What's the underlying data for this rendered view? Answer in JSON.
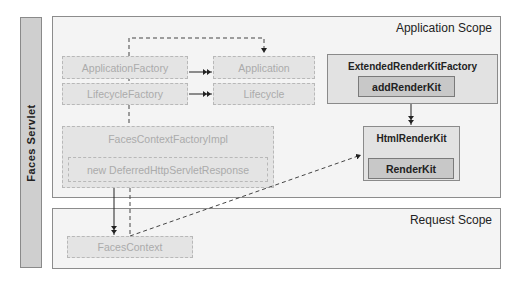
{
  "servlet": {
    "label": "Faces Servlet"
  },
  "scopes": {
    "application": {
      "title": "Application Scope"
    },
    "request": {
      "title": "Request Scope"
    }
  },
  "nodes": {
    "application_factory": "ApplicationFactory",
    "application": "Application",
    "lifecycle_factory": "LifecycleFactory",
    "lifecycle": "Lifecycle",
    "faces_context_factory_impl": "FacesContextFactoryImpl",
    "deferred_response": "new DeferredHttpServletResponse",
    "faces_context": "FacesContext",
    "extended_render_kit_factory": "ExtendedRenderKitFactory",
    "add_render_kit": "addRenderKit",
    "html_render_kit": "HtmlRenderKit",
    "render_kit": "RenderKit"
  },
  "colors": {
    "scope_bg": "#f4f4f4",
    "servlet_bar": "#cfcfcf",
    "ghost_box": "#e4e4e4",
    "ghost_text": "#ababab",
    "solid_box": "#e2e2e2",
    "method_box": "#c8c8c8",
    "border": "#8a8a8a"
  }
}
